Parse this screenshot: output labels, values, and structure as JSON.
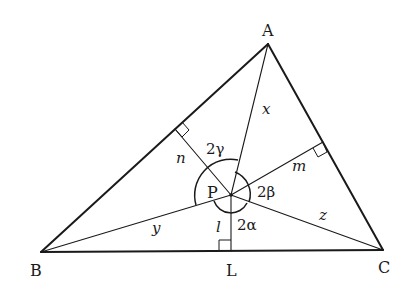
{
  "diagram": {
    "type": "geometry",
    "vertices": {
      "A": {
        "label": "A",
        "x": 268,
        "y": 44
      },
      "B": {
        "label": "B",
        "x": 41,
        "y": 252
      },
      "C": {
        "label": "C",
        "x": 383,
        "y": 250
      }
    },
    "point_P": {
      "label": "P",
      "x": 231,
      "y": 195
    },
    "foot_L": {
      "label": "L",
      "x": 231,
      "y": 252
    },
    "segment_labels": {
      "x": "x",
      "y": "y",
      "z": "z",
      "l": "l",
      "m": "m",
      "n": "n"
    },
    "angle_labels": {
      "alpha": "2α",
      "beta": "2β",
      "gamma": "2γ"
    }
  }
}
